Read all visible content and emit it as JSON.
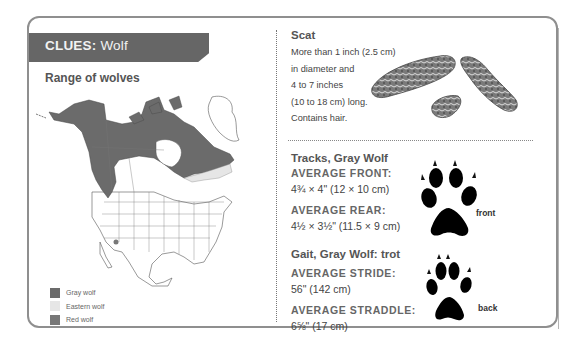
{
  "header": {
    "prefix": "CLUES:",
    "subject": "Wolf"
  },
  "range": {
    "title": "Range of wolves",
    "legend": [
      {
        "label": "Gray wolf",
        "color": "#6b6b6b"
      },
      {
        "label": "Eastern wolf",
        "color": "#e6e6e6"
      },
      {
        "label": "Red wolf",
        "color": "#777777"
      }
    ]
  },
  "scat": {
    "title": "Scat",
    "lines": [
      "More than 1 inch (2.5 cm)",
      "in diameter and",
      "4 to 7 inches",
      "(10 to 18 cm) long.",
      "Contains hair."
    ]
  },
  "tracks": {
    "title": "Tracks, Gray Wolf",
    "front_label": "AVERAGE FRONT:",
    "front_value": "4¾ × 4\" (12 × 10 cm)",
    "rear_label": "AVERAGE REAR:",
    "rear_value": "4½ × 3½\" (11.5 × 9 cm)",
    "front_print_label": "front"
  },
  "gait": {
    "title": "Gait, Gray Wolf: trot",
    "stride_label": "AVERAGE STRIDE:",
    "stride_value": "56\" (142 cm)",
    "straddle_label": "AVERAGE STRADDLE:",
    "straddle_value": "6⅝\" (17 cm)",
    "back_print_label": "back"
  },
  "colors": {
    "header_band": "#666666",
    "border": "#8f8f8f",
    "gray_wolf": "#6b6b6b"
  }
}
